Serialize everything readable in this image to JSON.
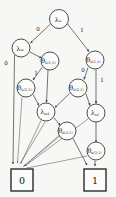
{
  "diagram": {
    "type": "decision-diagram",
    "background_color": "#f7f7f5",
    "node_fill": "#fbfbfa",
    "node_stroke": "#3a3a3a",
    "edge_color": "#454545",
    "nodes": [
      {
        "id": "n1",
        "symbol": "λ",
        "subscript": "n",
        "label": "λₙ",
        "kind": "lambda",
        "cx": 59,
        "cy": 19,
        "r": 9.5
      },
      {
        "id": "n2",
        "symbol": "λ",
        "subscript": "m",
        "label": "λₘ",
        "kind": "lambda",
        "cx": 21,
        "cy": 48,
        "r": 9.0
      },
      {
        "id": "n3",
        "symbol": "θ",
        "subscript": "b(1,1)",
        "label": "θb(1,1)",
        "kind": "theta",
        "cx": 50,
        "cy": 61,
        "r": 9.0
      },
      {
        "id": "n4",
        "symbol": "θ",
        "subscript": "b(1,1)",
        "label": "θb(1,1)",
        "kind": "theta",
        "cx": 95,
        "cy": 60,
        "r": 9.0
      },
      {
        "id": "n5",
        "symbol": "θ",
        "subscript": "b(2,1)",
        "label": "θb(2,1)",
        "kind": "theta",
        "cx": 26,
        "cy": 88,
        "r": 9.0
      },
      {
        "id": "n6",
        "symbol": "θ",
        "subscript": "b(2,1)",
        "label": "θb(2,1)",
        "kind": "theta",
        "cx": 78,
        "cy": 88,
        "r": 9.0
      },
      {
        "id": "n7",
        "symbol": "λ",
        "subscript": "m₁",
        "label": "λm₁",
        "kind": "lambda",
        "cx": 46,
        "cy": 112,
        "r": 9.0
      },
      {
        "id": "n8",
        "symbol": "λ",
        "subscript": "n₁",
        "label": "λn₁",
        "kind": "lambda",
        "cx": 96,
        "cy": 113,
        "r": 9.0
      },
      {
        "id": "n9",
        "symbol": "θ",
        "subscript": "a(2,1)",
        "label": "θa(2,1)",
        "kind": "theta",
        "cx": 67,
        "cy": 131,
        "r": 9.0
      },
      {
        "id": "n10",
        "symbol": "θ",
        "subscript": "a(2,1)",
        "label": "θa(2,1)",
        "kind": "theta",
        "cx": 96,
        "cy": 151,
        "r": 9.0
      }
    ],
    "terminals": [
      {
        "id": "t0",
        "label": "0",
        "x": 11,
        "y": 169,
        "w": 22,
        "h": 22
      },
      {
        "id": "t1",
        "label": "1",
        "x": 84,
        "y": 169,
        "w": 22,
        "h": 22
      }
    ],
    "edge_labels": [
      {
        "id": "e1",
        "text": "0",
        "x": 38,
        "y": 30
      },
      {
        "id": "e2",
        "text": "1",
        "x": 82,
        "y": 31
      },
      {
        "id": "e3",
        "text": "0",
        "x": 6,
        "y": 64
      },
      {
        "id": "e4",
        "text": "1",
        "x": 36,
        "y": 74
      },
      {
        "id": "e5",
        "text": "0",
        "x": 83,
        "y": 71
      },
      {
        "id": "e6",
        "text": "1",
        "x": 102,
        "y": 81
      }
    ]
  }
}
